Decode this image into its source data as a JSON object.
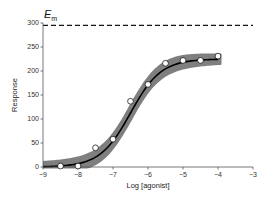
{
  "chart_data": {
    "type": "scatter",
    "title": "",
    "xlabel": "Log [agonist]",
    "ylabel": "Response",
    "xlim": [
      -9,
      -3
    ],
    "ylim": [
      0,
      300
    ],
    "x_ticks": [
      -9,
      -8,
      -7,
      -6,
      -5,
      -4,
      -3
    ],
    "x_tick_labels": [
      "−9",
      "−8",
      "−7",
      "−6",
      "−5",
      "−4",
      "−3"
    ],
    "y_ticks": [
      0,
      50,
      100,
      150,
      200,
      250,
      300
    ],
    "y_tick_labels": [
      "0",
      "50",
      "100",
      "150",
      "200",
      "250",
      "300"
    ],
    "grid": false,
    "legend": null,
    "series": [
      {
        "name": "Observed responses",
        "kind": "points",
        "x": [
          -8.5,
          -8.0,
          -7.5,
          -7.0,
          -6.5,
          -6.0,
          -5.5,
          -5.0,
          -4.5,
          -4.0
        ],
        "y": [
          2,
          2,
          40,
          58,
          137,
          172,
          216,
          222,
          222,
          231
        ]
      },
      {
        "name": "Fitted concentration-response curve",
        "kind": "line",
        "model": "sigmoid",
        "bottom": 0,
        "top": 225,
        "logEC50": -6.5,
        "hill_slope": 1.0,
        "x_range": [
          -9,
          -4
        ]
      },
      {
        "name": "Confidence band",
        "kind": "band",
        "x_range": [
          -9,
          -3.9
        ],
        "half_width": 20,
        "color": "#808080"
      }
    ],
    "annotations": [
      {
        "text": "E",
        "subscript": "m",
        "kind": "dashed-horizontal-line",
        "y": 295,
        "x_range": [
          -9,
          -3
        ]
      }
    ]
  },
  "annotations": {
    "em_main": "E",
    "em_sub": "m"
  },
  "axes": {
    "xlabel": "Log [agonist]",
    "ylabel": "Response"
  },
  "colors": {
    "band": "#7f7f7f",
    "line": "#000000",
    "points_fill": "#ffffff",
    "points_stroke": "#000000",
    "axis": "#555555"
  }
}
